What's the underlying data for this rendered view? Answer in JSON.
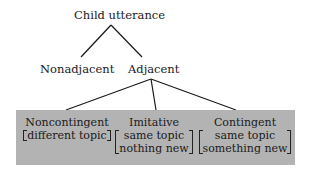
{
  "diagram": {
    "root": {
      "label": "Child utterance"
    },
    "level1": [
      {
        "label": "Nonadjacent"
      },
      {
        "label": "Adjacent"
      }
    ],
    "level2": [
      {
        "title": "Noncontingent",
        "features": [
          "different topic"
        ]
      },
      {
        "title": "Imitative",
        "features": [
          "same topic",
          "nothing new"
        ]
      },
      {
        "title": "Contingent",
        "features": [
          "same topic",
          "something new"
        ]
      }
    ],
    "colors": {
      "box": "#b3b3b3",
      "line": "#1a1a1a",
      "text": "#1a1a1a"
    }
  }
}
